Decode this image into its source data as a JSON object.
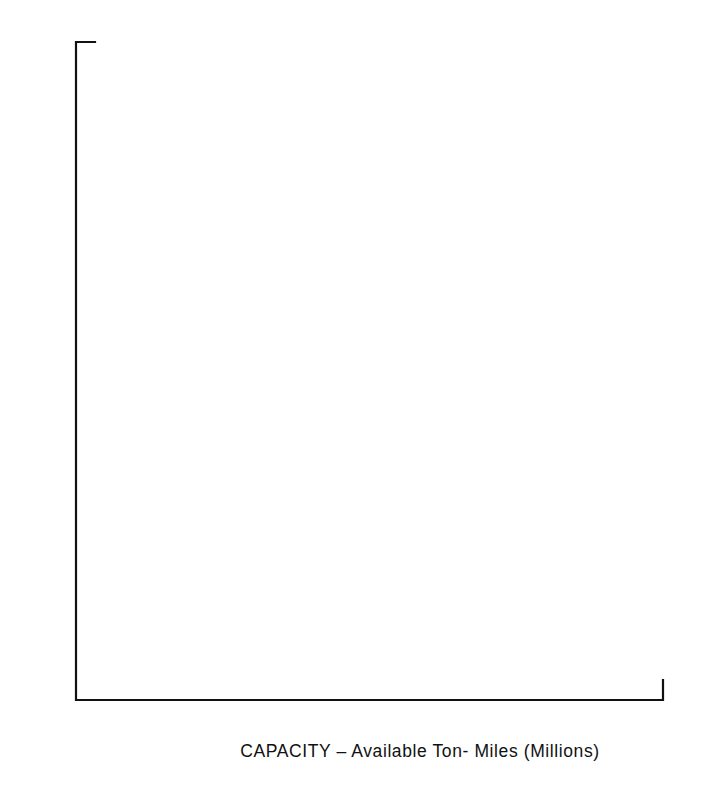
{
  "chart_data": {
    "type": "scatter",
    "title": "",
    "subtitle": "",
    "xlabel": "CAPACITY – Available Ton- Miles (Millions)",
    "ylabel": "",
    "xlim": [
      0,
      1000
    ],
    "ylim": [
      0,
      11.0
    ],
    "grid": false,
    "legend": "none",
    "x_ticks": [
      0,
      100,
      200,
      300,
      400,
      500,
      600,
      700,
      800,
      900,
      1000
    ],
    "x_tick_labels": [
      "0",
      "100",
      "200",
      "300",
      "400",
      "500",
      "600",
      "700",
      "800",
      "900",
      "1000"
    ],
    "y_ticks": [
      1.0,
      2.0,
      3.0,
      4.0,
      5.0,
      6.0,
      7.0,
      8.0,
      9.0,
      10.0,
      11.0
    ],
    "y_tick_labels": [
      "1.0",
      "2.0",
      "3.0",
      "4.0",
      "5.0",
      "6.0",
      "7.0",
      "8.0",
      "9.0",
      "10.0",
      "$11.0"
    ],
    "y_axis_currency_prefix": "$",
    "series": [
      {
        "name": "open-square",
        "marker": "open-square",
        "points": [
          {
            "x": 191,
            "y": 5.07
          },
          {
            "x": 237,
            "y": 7.22
          },
          {
            "x": 400,
            "y": 10.05
          },
          {
            "x": 612,
            "y": 8.79
          },
          {
            "x": 833,
            "y": 10.2
          }
        ]
      },
      {
        "name": "filled-circle",
        "marker": "filled-circle",
        "points": [
          {
            "x": 312,
            "y": 6.23
          },
          {
            "x": 467,
            "y": 9.38
          },
          {
            "x": 538,
            "y": 10.48
          },
          {
            "x": 690,
            "y": 10.32
          },
          {
            "x": 724,
            "y": 11.0
          }
        ]
      },
      {
        "name": "open-triangle",
        "marker": "open-triangle",
        "points": [
          {
            "x": 169,
            "y": 4.12
          },
          {
            "x": 169,
            "y": 3.54
          },
          {
            "x": 332,
            "y": 5.83
          },
          {
            "x": 361,
            "y": 6.34
          },
          {
            "x": 402,
            "y": 7.56
          }
        ]
      },
      {
        "name": "cross",
        "marker": "x",
        "points": [
          {
            "x": 78,
            "y": 2.1
          },
          {
            "x": 104,
            "y": 2.16
          },
          {
            "x": 227,
            "y": 3.84
          },
          {
            "x": 361,
            "y": 5.3
          },
          {
            "x": 475,
            "y": 7.96
          }
        ]
      },
      {
        "name": "open-circle",
        "marker": "open-circle",
        "points": [
          {
            "x": 167,
            "y": 2.7
          },
          {
            "x": 221,
            "y": 3.31
          },
          {
            "x": 249,
            "y": 3.14
          },
          {
            "x": 259,
            "y": 3.25
          },
          {
            "x": 302,
            "y": 3.39
          }
        ]
      }
    ]
  },
  "figure": {
    "background_color": "#ffffff",
    "ink_color": "#141414"
  }
}
